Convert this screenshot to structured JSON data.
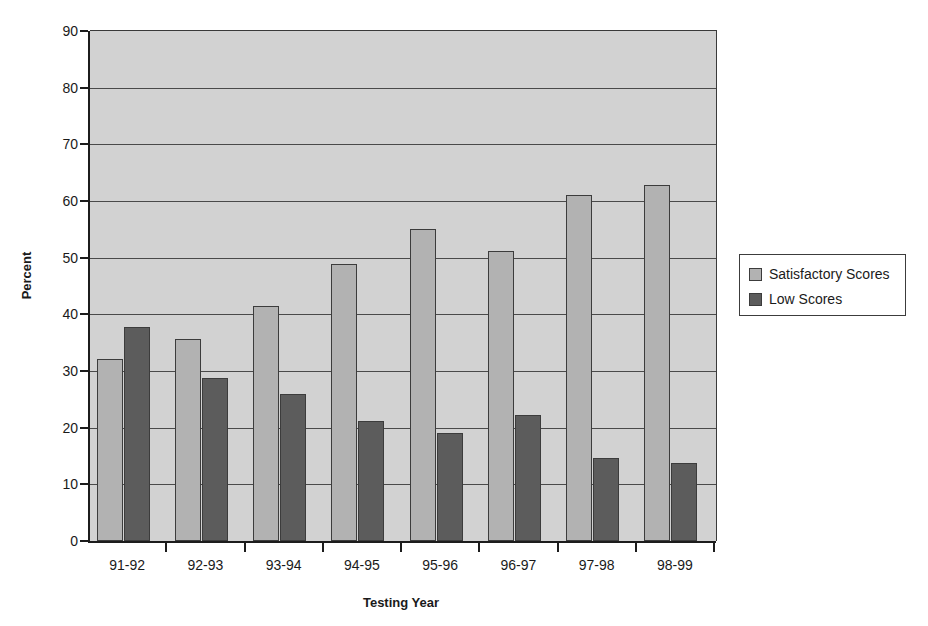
{
  "chart_data": {
    "type": "bar",
    "title": "",
    "xlabel": "Testing Year",
    "ylabel": "Percent",
    "ylim": [
      0,
      90
    ],
    "ytick_step": 10,
    "yticks": [
      90,
      80,
      70,
      60,
      50,
      40,
      30,
      20,
      10,
      0
    ],
    "grid": true,
    "legend_position": "right",
    "categories": [
      "91-92",
      "92-93",
      "93-94",
      "94-95",
      "95-96",
      "96-97",
      "97-98",
      "98-99"
    ],
    "series": [
      {
        "name": "Satisfactory Scores",
        "color": "#b2b2b2",
        "values": [
          32.2,
          35.6,
          41.5,
          48.8,
          55.0,
          51.1,
          61.0,
          62.8
        ]
      },
      {
        "name": "Low Scores",
        "color": "#5c5c5c",
        "values": [
          37.8,
          28.8,
          26.0,
          21.2,
          19.1,
          22.3,
          14.6,
          13.7
        ]
      }
    ],
    "plot_background": "#d2d2d2",
    "axis_color": "#1c1c1c"
  },
  "legend": {
    "entries": [
      {
        "label": "Satisfactory Scores",
        "swatch": "sat"
      },
      {
        "label": "Low Scores",
        "swatch": "low"
      }
    ]
  }
}
